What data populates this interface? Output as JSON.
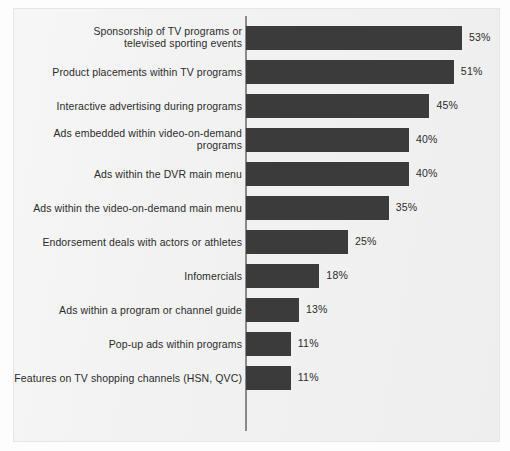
{
  "chart_data": {
    "type": "bar",
    "orientation": "horizontal",
    "title": "",
    "subtitle": "",
    "xlabel": "",
    "ylabel": "",
    "grid": false,
    "legend": null,
    "value_suffix": "%",
    "xlim": [
      0,
      53
    ],
    "categories": [
      "Sponsorship of TV programs or televised sporting events",
      "Product placements within TV programs",
      "Interactive advertising during programs",
      "Ads embedded within video-on-demand programs",
      "Ads within the DVR main menu",
      "Ads within the video-on-demand main menu",
      "Endorsement deals with actors or athletes",
      "Infomercials",
      "Ads within a program or channel guide",
      "Pop-up ads within programs",
      "Features on TV shopping channels (HSN, QVC)"
    ],
    "values": [
      53,
      51,
      45,
      40,
      40,
      35,
      25,
      18,
      13,
      11,
      11
    ],
    "value_labels": [
      "53%",
      "51%",
      "45%",
      "40%",
      "40%",
      "35%",
      "25%",
      "18%",
      "13%",
      "11%",
      "11%"
    ],
    "bars": [
      {
        "label_line1": "Sponsorship of TV programs or",
        "label_line2": "televised sporting events",
        "value": 53,
        "value_label": "53%"
      },
      {
        "label_line1": "Product placements within TV programs",
        "label_line2": "",
        "value": 51,
        "value_label": "51%"
      },
      {
        "label_line1": "Interactive advertising during programs",
        "label_line2": "",
        "value": 45,
        "value_label": "45%"
      },
      {
        "label_line1": "Ads embedded within video-on-demand",
        "label_line2": "programs",
        "value": 40,
        "value_label": "40%"
      },
      {
        "label_line1": "Ads within the DVR main menu",
        "label_line2": "",
        "value": 40,
        "value_label": "40%"
      },
      {
        "label_line1": "Ads within the video-on-demand main menu",
        "label_line2": "",
        "value": 35,
        "value_label": "35%"
      },
      {
        "label_line1": "Endorsement deals with actors or athletes",
        "label_line2": "",
        "value": 25,
        "value_label": "25%"
      },
      {
        "label_line1": "Infomercials",
        "label_line2": "",
        "value": 18,
        "value_label": "18%"
      },
      {
        "label_line1": "Ads within a program or channel guide",
        "label_line2": "",
        "value": 13,
        "value_label": "13%"
      },
      {
        "label_line1": "Pop-up ads within programs",
        "label_line2": "",
        "value": 11,
        "value_label": "11%"
      },
      {
        "label_line1": "Features on TV shopping channels (HSN, QVC)",
        "label_line2": "",
        "value": 11,
        "value_label": "11%"
      }
    ]
  },
  "style": {
    "bar_color": "#3b3b3b",
    "panel_background": "#f2f2f2",
    "text_color": "#2b2b2b",
    "axis_color": "#8a8a8a"
  }
}
